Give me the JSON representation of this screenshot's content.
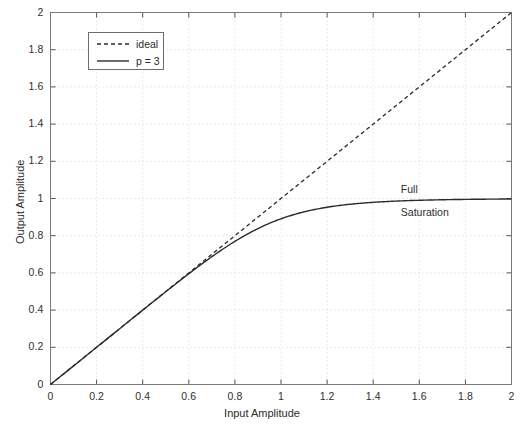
{
  "chart_data": {
    "type": "line",
    "title": "",
    "xlabel": "Input Amplitude",
    "ylabel": "Output Amplitude",
    "xlim": [
      0,
      2
    ],
    "ylim": [
      0,
      2
    ],
    "grid": true,
    "grid_style": "dotted",
    "legend_position": "upper left",
    "xticks": [
      "0",
      "0.2",
      "0.4",
      "0.6",
      "0.8",
      "1",
      "1.2",
      "1.4",
      "1.6",
      "1.8",
      "2"
    ],
    "xtick_values": [
      0,
      0.2,
      0.4,
      0.6,
      0.8,
      1,
      1.2,
      1.4,
      1.6,
      1.8,
      2
    ],
    "yticks": [
      "0",
      "0.2",
      "0.4",
      "0.6",
      "0.8",
      "1",
      "1.2",
      "1.4",
      "1.6",
      "1.8",
      "2"
    ],
    "ytick_values": [
      0,
      0.2,
      0.4,
      0.6,
      0.8,
      1,
      1.2,
      1.4,
      1.6,
      1.8,
      2
    ],
    "series": [
      {
        "name": "ideal",
        "style": "dashed",
        "color": "#2b2b2b",
        "x": [
          0,
          0.2,
          0.4,
          0.6,
          0.8,
          1.0,
          1.2,
          1.4,
          1.6,
          1.8,
          2.0
        ],
        "values": [
          0,
          0.2,
          0.4,
          0.6,
          0.8,
          1.0,
          1.2,
          1.4,
          1.6,
          1.8,
          2.0
        ]
      },
      {
        "name": "p = 3",
        "style": "solid",
        "color": "#2b2b2b",
        "x": [
          0,
          0.1,
          0.2,
          0.3,
          0.4,
          0.5,
          0.6,
          0.7,
          0.8,
          0.9,
          1.0,
          1.1,
          1.2,
          1.3,
          1.4,
          1.5,
          1.6,
          1.7,
          1.8,
          1.9,
          2.0
        ],
        "values": [
          0,
          0.1,
          0.2,
          0.3,
          0.4,
          0.4998,
          0.5972,
          0.6877,
          0.7657,
          0.8268,
          0.8909,
          0.9255,
          0.9534,
          0.9713,
          0.9824,
          0.9891,
          0.9932,
          0.9957,
          0.9973,
          0.9983,
          0.9989
        ]
      }
    ],
    "annotations": [
      {
        "id": "full",
        "text": "Full",
        "x": 1.52,
        "y": 1.045
      },
      {
        "id": "saturation",
        "text": "Saturation",
        "x": 1.52,
        "y": 0.92
      }
    ]
  },
  "legend": {
    "entries": [
      {
        "label": "ideal",
        "style": "dashed"
      },
      {
        "label": "p = 3",
        "style": "solid"
      }
    ]
  }
}
